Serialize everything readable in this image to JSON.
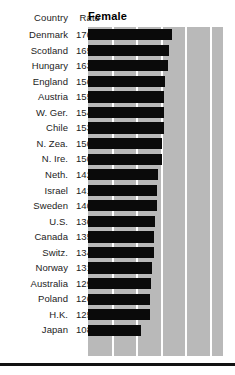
{
  "header": {
    "country_label": "Country",
    "rate_label": "Rate",
    "series_label": "Female"
  },
  "colors": {
    "bar": "#0a0a0a",
    "panel_background": "#b9b9b9",
    "gridline": "#ffffff",
    "rule": "#121212",
    "text": "#1c1c1c"
  },
  "chart_data": {
    "type": "bar",
    "title": "Female",
    "xlabel": "",
    "ylabel": "Country",
    "orientation": "horizontal",
    "grid": true,
    "legend": "none",
    "xlim": [
      0,
      275
    ],
    "gridline_values": [
      50,
      100,
      150,
      200,
      250
    ],
    "categories": [
      "Denmark",
      "Scotland",
      "Hungary",
      "England",
      "Austria",
      "W. Ger.",
      "Chile",
      "N. Zea.",
      "N. Ire.",
      "Neth.",
      "Israel",
      "Sweden",
      "U.S.",
      "Canada",
      "Switz.",
      "Norway",
      "Australia",
      "Poland",
      "H.K.",
      "Japan"
    ],
    "values": [
      170.9,
      165.8,
      163.6,
      156.0,
      155.3,
      154.8,
      153.8,
      150.7,
      150.4,
      142.6,
      141.3,
      140.9,
      136.3,
      135.3,
      134.2,
      131.2,
      129.2,
      126.4,
      125.3,
      108.7
    ],
    "value_labels": [
      "170.9",
      "165.8",
      "163.6",
      "156.0",
      "155.3",
      "154.8",
      "153.8",
      "150.7",
      "150.4",
      "142.6",
      "141.3",
      "140.9",
      "136.3",
      "135.3",
      "134.2",
      "131.2",
      "129.2",
      "126.4",
      "125.3",
      "108.7"
    ]
  }
}
